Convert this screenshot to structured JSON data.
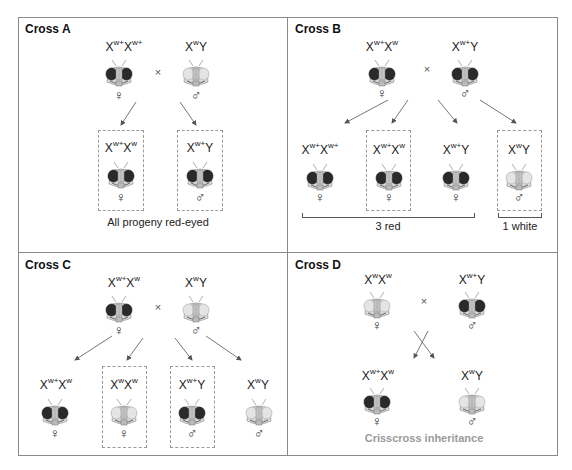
{
  "panels": {
    "a": {
      "title": "Cross A",
      "parents": [
        {
          "genotype": {
            "base1": "X",
            "sup1": "w+",
            "base2": "X",
            "sup2": "w+"
          },
          "eye": "red",
          "sex": "♀"
        },
        {
          "genotype": {
            "base1": "X",
            "sup1": "w",
            "base2": "Y",
            "sup2": ""
          },
          "eye": "white",
          "sex": "♂"
        }
      ],
      "cross_symbol": "×",
      "progeny": [
        {
          "genotype": {
            "base1": "X",
            "sup1": "w+",
            "base2": "X",
            "sup2": "w"
          },
          "eye": "red",
          "sex": "♀",
          "boxed": true
        },
        {
          "genotype": {
            "base1": "X",
            "sup1": "w+",
            "base2": "Y",
            "sup2": ""
          },
          "eye": "red",
          "sex": "♂",
          "boxed": true
        }
      ],
      "caption": "All progeny red-eyed"
    },
    "b": {
      "title": "Cross B",
      "parents": [
        {
          "genotype": {
            "base1": "X",
            "sup1": "w+",
            "base2": "X",
            "sup2": "w"
          },
          "eye": "red",
          "sex": "♀"
        },
        {
          "genotype": {
            "base1": "X",
            "sup1": "w+",
            "base2": "Y",
            "sup2": ""
          },
          "eye": "red",
          "sex": "♂"
        }
      ],
      "cross_symbol": "×",
      "progeny": [
        {
          "genotype": {
            "base1": "X",
            "sup1": "w+",
            "base2": "X",
            "sup2": "w+"
          },
          "eye": "red",
          "sex": "♀",
          "boxed": false
        },
        {
          "genotype": {
            "base1": "X",
            "sup1": "w+",
            "base2": "X",
            "sup2": "w"
          },
          "eye": "red",
          "sex": "♀",
          "boxed": true
        },
        {
          "genotype": {
            "base1": "X",
            "sup1": "w+",
            "base2": "Y",
            "sup2": ""
          },
          "eye": "red",
          "sex": "♀",
          "boxed": false
        },
        {
          "genotype": {
            "base1": "X",
            "sup1": "w",
            "base2": "Y",
            "sup2": ""
          },
          "eye": "white",
          "sex": "♂",
          "boxed": true
        }
      ],
      "bracket_labels": [
        "3 red",
        "1 white"
      ]
    },
    "c": {
      "title": "Cross C",
      "parents": [
        {
          "genotype": {
            "base1": "X",
            "sup1": "w+",
            "base2": "X",
            "sup2": "w"
          },
          "eye": "red",
          "sex": "♀"
        },
        {
          "genotype": {
            "base1": "X",
            "sup1": "w",
            "base2": "Y",
            "sup2": ""
          },
          "eye": "white",
          "sex": "♂"
        }
      ],
      "cross_symbol": "×",
      "progeny": [
        {
          "genotype": {
            "base1": "X",
            "sup1": "w+",
            "base2": "X",
            "sup2": "w"
          },
          "eye": "red",
          "sex": "♀",
          "boxed": false
        },
        {
          "genotype": {
            "base1": "X",
            "sup1": "w",
            "base2": "X",
            "sup2": "w"
          },
          "eye": "white",
          "sex": "♀",
          "boxed": true
        },
        {
          "genotype": {
            "base1": "X",
            "sup1": "w+",
            "base2": "Y",
            "sup2": ""
          },
          "eye": "red",
          "sex": "♂",
          "boxed": true
        },
        {
          "genotype": {
            "base1": "X",
            "sup1": "w",
            "base2": "Y",
            "sup2": ""
          },
          "eye": "white",
          "sex": "♂",
          "boxed": false
        }
      ]
    },
    "d": {
      "title": "Cross D",
      "parents": [
        {
          "genotype": {
            "base1": "X",
            "sup1": "w",
            "base2": "X",
            "sup2": "w"
          },
          "eye": "white",
          "sex": "♀"
        },
        {
          "genotype": {
            "base1": "X",
            "sup1": "w+",
            "base2": "Y",
            "sup2": ""
          },
          "eye": "red",
          "sex": "♂"
        }
      ],
      "cross_symbol": "×",
      "progeny": [
        {
          "genotype": {
            "base1": "X",
            "sup1": "w+",
            "base2": "X",
            "sup2": "w"
          },
          "eye": "red",
          "sex": "♀",
          "boxed": false
        },
        {
          "genotype": {
            "base1": "X",
            "sup1": "w",
            "base2": "Y",
            "sup2": ""
          },
          "eye": "white",
          "sex": "♂",
          "boxed": false
        }
      ],
      "caption": "Crisscross inheritance"
    }
  },
  "colors": {
    "red_eye": "#2a2a2a",
    "white_eye": "#e4e4e4",
    "border": "#8a8a8a",
    "dashed_box": "#999999",
    "caption_gray": "#9a9a9a"
  }
}
